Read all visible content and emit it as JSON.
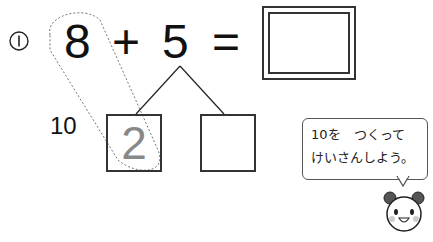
{
  "problem": {
    "number_label": "①",
    "addend1": "8",
    "operator": "+",
    "addend2": "5",
    "equals": "=",
    "answer": "",
    "ten_label": "10",
    "decomposition": [
      "2",
      ""
    ]
  },
  "hint": {
    "line1": "10を　つくって",
    "line2": "けいさんしよう。"
  },
  "colors": {
    "ink": "#111111",
    "faded_digit": "#888888",
    "dotted_loop": "#777777",
    "panda_ear": "#555555",
    "panda_cheek": "#cccccc"
  }
}
